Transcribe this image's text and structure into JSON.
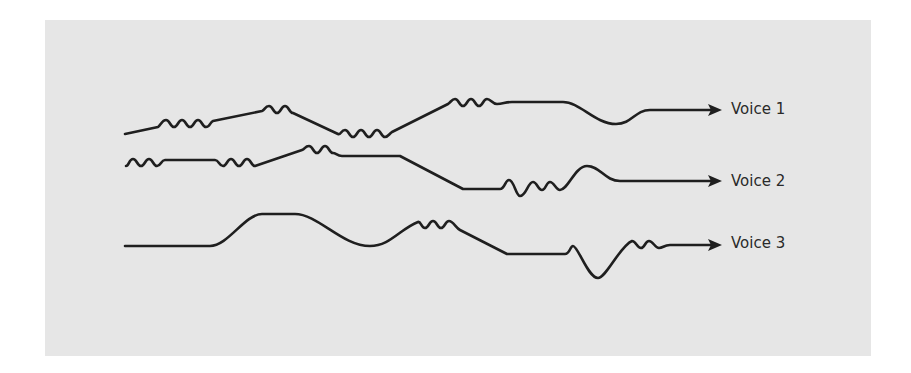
{
  "diagram": {
    "background_color": "#e6e6e6",
    "stroke_color": "#1f1f1f",
    "voices": [
      {
        "label": "Voice 1",
        "label_x": 731,
        "label_y": 100,
        "path": "M125,134 L158,127 C161,125 162,120 166,120 C170,120 170,127 174,127 C178,127 178,120 182,120 C186,120 186,127 190,127 C194,127 194,120 198,120 C202,120 202,127 206,127 C210,127 210,122 213,121 L262,111 C265,110 265,106 269,106 C273,106 273,113 277,113 C281,113 281,106 285,106 C289,106 289,113 293,113 L338,134 C341,135 341,130 345,130 C349,130 349,137 353,137 C357,137 357,130 361,130 C365,130 365,137 369,137 C373,137 373,130 377,130 C381,130 381,137 385,137 C388,137 389,134 392,132 L448,104 C451,102 452,99 455,99 C459,99 459,106 463,106 C467,106 467,99 471,99 C475,99 475,106 479,106 C483,106 483,99 487,99 C491,99 492,104 497,104 C503,104 505,102 512,102 L563,102 C580,102 595,124 616,124 C632,124 635,110 650,110 L712,110",
        "arrow_tip": [
          722,
          110
        ]
      },
      {
        "label": "Voice 2",
        "label_x": 731,
        "label_y": 172,
        "path": "M126,166 C129,166 129,159 133,159 C137,159 137,166 141,166 C145,166 145,159 149,159 C153,159 153,166 157,166 C161,166 161,160 165,160 L215,160 C219,160 219,166 223,166 C227,166 227,159 231,159 C235,159 235,166 239,166 C243,166 243,159 247,159 C251,159 251,166 255,166 L302,150 C305,149 305,146 309,146 C313,146 313,153 317,153 C321,153 321,146 325,146 C329,146 329,153 333,153 C336,153 337,156 342,156 L400,156 L463,189 L500,189 C505,189 505,180 509,180 C514,180 516,196 520,196 C526,196 528,182 533,182 C537,182 538,190 542,190 C546,190 546,182 550,182 C554,182 556,190 560,190 C568,190 575,166 587,166 C600,166 605,181 620,181 L712,181",
        "arrow_tip": [
          722,
          181
        ]
      },
      {
        "label": "Voice 3",
        "label_x": 731,
        "label_y": 234,
        "path": "M125,246 L210,246 C228,246 245,214 262,214 L295,214 C318,214 342,246 370,246 C390,246 400,229 418,222 C421,221 421,228 425,228 C429,228 429,221 433,221 C437,221 437,228 441,228 C445,228 445,221 449,221 C453,221 456,228 460,230 L507,254 L565,254 C570,254 570,246 573,246 C578,246 588,278 598,278 C606,278 620,246 632,241 C636,241 637,248 641,248 C645,248 645,241 649,241 C653,241 655,248 659,248 C663,248 664,245 670,245 L712,245",
        "arrow_tip": [
          722,
          245
        ]
      }
    ]
  }
}
